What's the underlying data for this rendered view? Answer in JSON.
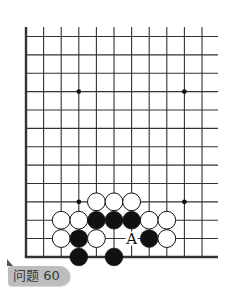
{
  "diagram": {
    "type": "go-board-fragment",
    "columns_visible": 11,
    "rows_visible": 13,
    "edges": [
      "left",
      "bottom"
    ],
    "star_points": [
      {
        "col": 3,
        "row": 3
      },
      {
        "col": 9,
        "row": 3
      },
      {
        "col": 3,
        "row": 9
      },
      {
        "col": 9,
        "row": 9
      }
    ],
    "stones": [
      {
        "color": "white",
        "col": 4,
        "row": 9
      },
      {
        "color": "white",
        "col": 5,
        "row": 9
      },
      {
        "color": "white",
        "col": 6,
        "row": 9
      },
      {
        "color": "white",
        "col": 2,
        "row": 10
      },
      {
        "color": "white",
        "col": 3,
        "row": 10
      },
      {
        "color": "black",
        "col": 4,
        "row": 10
      },
      {
        "color": "black",
        "col": 5,
        "row": 10
      },
      {
        "color": "black",
        "col": 6,
        "row": 10
      },
      {
        "color": "white",
        "col": 7,
        "row": 10
      },
      {
        "color": "white",
        "col": 8,
        "row": 10
      },
      {
        "color": "white",
        "col": 2,
        "row": 11
      },
      {
        "color": "black",
        "col": 3,
        "row": 11
      },
      {
        "color": "white",
        "col": 4,
        "row": 11
      },
      {
        "color": "black",
        "col": 7,
        "row": 11
      },
      {
        "color": "white",
        "col": 8,
        "row": 11
      },
      {
        "color": "black",
        "col": 3,
        "row": 12
      },
      {
        "color": "black",
        "col": 5,
        "row": 12
      }
    ],
    "markers": [
      {
        "text": "A",
        "col": 6,
        "row": 11
      }
    ],
    "colors": {
      "line": "#333333",
      "black_stone": "#111111",
      "white_stone": "#ffffff",
      "label_bg": "#bdbdbd"
    }
  },
  "label": {
    "text": "问题 60"
  }
}
